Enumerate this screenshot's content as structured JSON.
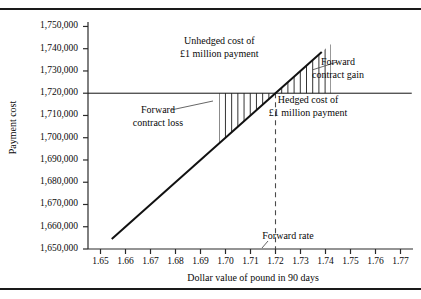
{
  "figure": {
    "kind": "line-chart-with-shaded-regions",
    "has_top_rule": true,
    "has_bottom_rule": true
  },
  "chart_data": {
    "type": "line",
    "title": "",
    "xlabel": "Dollar value of pound in 90 days",
    "ylabel": "Payment cost",
    "xlim": [
      1.645,
      1.775
    ],
    "ylim": [
      1650000,
      1752000
    ],
    "grid": false,
    "legend": "none",
    "xticks": [
      "1.65",
      "1.66",
      "1.67",
      "1.68",
      "1.69",
      "1.70",
      "1.71",
      "1.72",
      "1.73",
      "1.74",
      "1.75",
      "1.76",
      "1.77"
    ],
    "xtick_values": [
      1.65,
      1.66,
      1.67,
      1.68,
      1.69,
      1.7,
      1.71,
      1.72,
      1.73,
      1.74,
      1.75,
      1.76,
      1.77
    ],
    "yticks": [
      "1,650,000",
      "1,660,000",
      "1,670,000",
      "1,680,000",
      "1,690,000",
      "1,700,000",
      "1,710,000",
      "1,720,000",
      "1,730,000",
      "1,740,000",
      "1,750,000"
    ],
    "ytick_values": [
      1650000,
      1660000,
      1670000,
      1680000,
      1690000,
      1700000,
      1710000,
      1720000,
      1730000,
      1740000,
      1750000
    ],
    "series": [
      {
        "name": "Unhedged cost of £1 million payment",
        "style": "solid-diagonal",
        "x": [
          1.6545,
          1.7385
        ],
        "values": [
          1654500,
          1738500
        ],
        "color": "#111111"
      },
      {
        "name": "Hedged cost of £1 million payment",
        "style": "solid-horizontal",
        "x": [
          1.645,
          1.7745
        ],
        "values": [
          1720000,
          1720000
        ],
        "color": "#111111"
      },
      {
        "name": "Forward rate",
        "style": "dashed-vertical",
        "x": [
          1.72,
          1.72
        ],
        "values": [
          1650000,
          1720000
        ],
        "color": "#444444"
      }
    ],
    "shaded_regions": [
      {
        "name": "Forward contract loss",
        "hatch": "vertical-lines",
        "x_range": [
          1.6975,
          1.72
        ],
        "between": [
          "unhedged-line",
          "hedged-line"
        ],
        "side": "below"
      },
      {
        "name": "Forward contract gain",
        "hatch": "vertical-lines",
        "x_range": [
          1.72,
          1.742
        ],
        "between": [
          "unhedged-line",
          "hedged-line"
        ],
        "side": "above"
      }
    ],
    "annotations": [
      {
        "name": "unhedged-cost",
        "lines": [
          "Unhedged cost of",
          "£1 million payment"
        ],
        "x": 1.6975,
        "y": 1743000
      },
      {
        "name": "forward-contract-gain",
        "lines": [
          "Forward",
          "contract gain"
        ],
        "x": 1.745,
        "y": 1733500
      },
      {
        "name": "hedged-cost",
        "lines": [
          "Hedged cost of",
          "£1 million payment"
        ],
        "x": 1.733,
        "y": 1716500
      },
      {
        "name": "forward-contract-loss",
        "lines": [
          "Forward",
          "contract loss"
        ],
        "x": 1.673,
        "y": 1712000
      },
      {
        "name": "forward-rate",
        "lines": [
          "Forward rate"
        ],
        "x": 1.725,
        "y": 1655500
      }
    ]
  },
  "axis": {
    "ylabel_text": "Payment cost",
    "xlabel_text": "Dollar value of pound in 90 days"
  },
  "colors": {
    "line": "#111111",
    "axis": "#2a2a2a",
    "dashed": "#4a4a4a",
    "hatch": "#333333",
    "rule": "#1a1a1a",
    "background": "#ffffff"
  }
}
